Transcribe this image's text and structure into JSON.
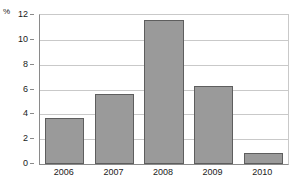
{
  "chart_data": {
    "type": "bar",
    "title": "",
    "xlabel": "",
    "ylabel": "%",
    "categories": [
      "2006",
      "2007",
      "2008",
      "2009",
      "2010"
    ],
    "values": [
      3.7,
      5.6,
      11.6,
      6.3,
      0.9
    ],
    "ylim": [
      0,
      12
    ],
    "ytick_labels": [
      "0",
      "2",
      "4",
      "6",
      "8",
      "10",
      "12"
    ],
    "ytick_values": [
      0,
      2,
      4,
      6,
      8,
      10,
      12
    ],
    "grid": true,
    "legend": "none",
    "bar_color": "#9a9a9a",
    "bar_border_color": "#5e5e5e",
    "grid_color": "#c9c9c9",
    "axis_color": "#8a8a8a",
    "text_color": "#1a1a1a"
  }
}
